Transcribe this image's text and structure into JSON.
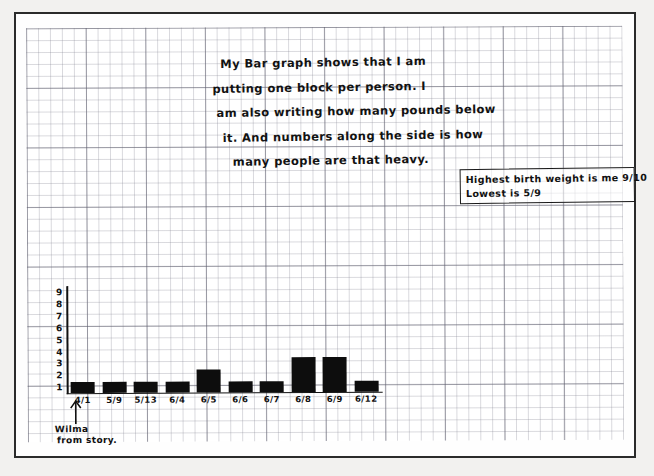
{
  "document": {
    "medium": "graph-paper",
    "ink_color": "#111111"
  },
  "headnote": {
    "lines": [
      "My Bar graph shows that I am",
      "putting one block per person. I",
      "am also writing how many pounds below",
      "it. And numbers along the side is how",
      "many people are that heavy."
    ]
  },
  "callout": {
    "lines": [
      "Highest birth weight is me 9/10",
      "Lowest is 5/9"
    ]
  },
  "annotation": {
    "arrow_icon": "up-arrow-icon",
    "lines": [
      "Wilma",
      "from story."
    ]
  },
  "chart_data": {
    "type": "bar",
    "title": "My Bar graph shows that I am putting one block per person.",
    "xlabel": "",
    "ylabel": "",
    "categories": [
      "4/1",
      "5/9",
      "5/13",
      "6/4",
      "6/5",
      "6/6",
      "6/7",
      "6/8",
      "6/9",
      "6/12"
    ],
    "values": [
      1,
      1,
      1,
      1,
      2,
      1,
      1,
      3,
      3,
      1
    ],
    "ylim": [
      0,
      9
    ],
    "yticks": [
      "9",
      "8",
      "7",
      "6",
      "5",
      "4",
      "3",
      "2",
      "1"
    ],
    "grid": true,
    "legend": "none",
    "annotations": [
      "Wilma from story. (points to 4/1)",
      "Highest birth weight is me 9/10",
      "Lowest is 5/9"
    ]
  }
}
